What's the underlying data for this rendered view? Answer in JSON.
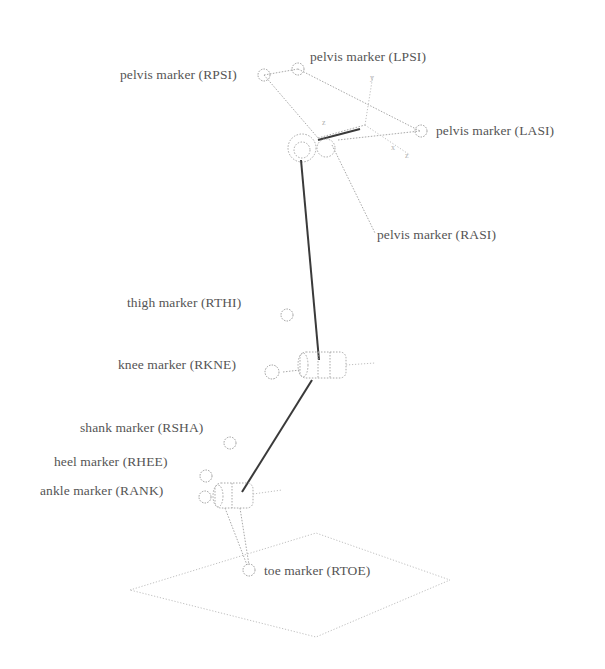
{
  "diagram": {
    "colors": {
      "background": "#ffffff",
      "segment": "#3a3a3a",
      "outline": "#a8a8a8",
      "label": "#555555"
    },
    "markers": [
      {
        "id": "RPSI",
        "label": "pelvis marker (RPSI)",
        "segment": "pelvis"
      },
      {
        "id": "LPSI",
        "label": "pelvis marker (LPSI)",
        "segment": "pelvis"
      },
      {
        "id": "LASI",
        "label": "pelvis marker (LASI)",
        "segment": "pelvis"
      },
      {
        "id": "RASI",
        "label": "pelvis marker (RASI)",
        "segment": "pelvis"
      },
      {
        "id": "RTHI",
        "label": "thigh marker (RTHI)",
        "segment": "thigh"
      },
      {
        "id": "RKNE",
        "label": "knee marker (RKNE)",
        "segment": "knee"
      },
      {
        "id": "RSHA",
        "label": "shank marker (RSHA)",
        "segment": "shank"
      },
      {
        "id": "RHEE",
        "label": "heel marker (RHEE)",
        "segment": "foot"
      },
      {
        "id": "RANK",
        "label": "ankle marker (RANK)",
        "segment": "ankle"
      },
      {
        "id": "RTOE",
        "label": "toe marker (RTOE)",
        "segment": "foot"
      }
    ],
    "axis_labels": {
      "pelvis_x": "x",
      "pelvis_y": "y",
      "pelvis_z": "z",
      "pelvis_z2": "z"
    }
  }
}
